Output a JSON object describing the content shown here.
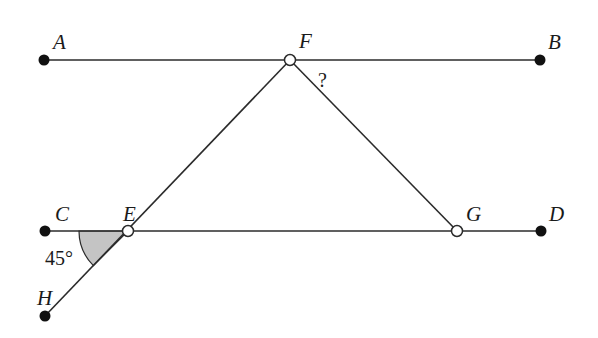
{
  "diagram": {
    "type": "geometry",
    "points": {
      "A": {
        "label": "A",
        "x": 44,
        "y": 60,
        "style": "filled"
      },
      "F": {
        "label": "F",
        "x": 290,
        "y": 60,
        "style": "open"
      },
      "B": {
        "label": "B",
        "x": 540,
        "y": 60,
        "style": "filled"
      },
      "C": {
        "label": "C",
        "x": 45,
        "y": 231,
        "style": "filled"
      },
      "E": {
        "label": "E",
        "x": 128,
        "y": 231,
        "style": "open"
      },
      "G": {
        "label": "G",
        "x": 457,
        "y": 231,
        "style": "open"
      },
      "D": {
        "label": "D",
        "x": 541,
        "y": 231,
        "style": "filled"
      },
      "H": {
        "label": "H",
        "x": 45,
        "y": 316,
        "style": "filled"
      }
    },
    "segments": [
      {
        "from": "A",
        "to": "B"
      },
      {
        "from": "C",
        "to": "D"
      },
      {
        "from": "H",
        "to": "F"
      },
      {
        "from": "F",
        "to": "G"
      }
    ],
    "angles": [
      {
        "name": "angle-CEH",
        "vertex": "E",
        "value_label": "45°",
        "shaded": true,
        "shade_color": "#c4c4c4"
      },
      {
        "name": "angle-BFG",
        "vertex": "F",
        "value_label": "?",
        "shaded": false
      }
    ],
    "colors": {
      "line": "#2b2b2b",
      "point_fill": "#111111",
      "open_point_fill": "#ffffff",
      "shade": "#c4c4c4"
    }
  },
  "labels": {
    "A": "A",
    "B": "B",
    "C": "C",
    "D": "D",
    "E": "E",
    "F": "F",
    "G": "G",
    "H": "H",
    "angle_45": "45°",
    "unknown": "?"
  }
}
